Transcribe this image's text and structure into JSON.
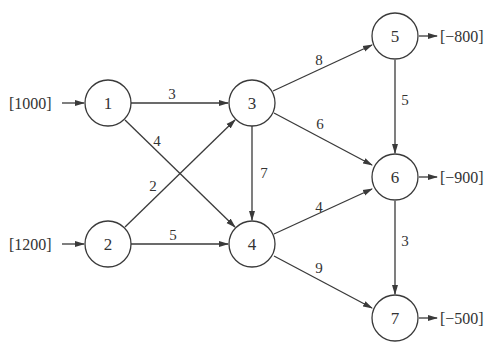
{
  "diagram": {
    "type": "network-flow",
    "nodes": [
      {
        "id": "1",
        "label": "1",
        "x": 108,
        "y": 103,
        "supply": "[1000]"
      },
      {
        "id": "2",
        "label": "2",
        "x": 108,
        "y": 244,
        "supply": "[1200]"
      },
      {
        "id": "3",
        "label": "3",
        "x": 252,
        "y": 103
      },
      {
        "id": "4",
        "label": "4",
        "x": 252,
        "y": 244
      },
      {
        "id": "5",
        "label": "5",
        "x": 395,
        "y": 36,
        "supply": "[−800]"
      },
      {
        "id": "6",
        "label": "6",
        "x": 395,
        "y": 177,
        "supply": "[−900]"
      },
      {
        "id": "7",
        "label": "7",
        "x": 395,
        "y": 318,
        "supply": "[−500]"
      }
    ],
    "edges": [
      {
        "from": "1",
        "to": "3",
        "cost": "3"
      },
      {
        "from": "1",
        "to": "4",
        "cost": "4"
      },
      {
        "from": "2",
        "to": "3",
        "cost": "2"
      },
      {
        "from": "2",
        "to": "4",
        "cost": "5"
      },
      {
        "from": "3",
        "to": "5",
        "cost": "8"
      },
      {
        "from": "3",
        "to": "6",
        "cost": "6"
      },
      {
        "from": "3",
        "to": "4",
        "cost": "7"
      },
      {
        "from": "4",
        "to": "6",
        "cost": "4"
      },
      {
        "from": "4",
        "to": "7",
        "cost": "9"
      },
      {
        "from": "5",
        "to": "6",
        "cost": "5"
      },
      {
        "from": "6",
        "to": "7",
        "cost": "3"
      }
    ]
  }
}
